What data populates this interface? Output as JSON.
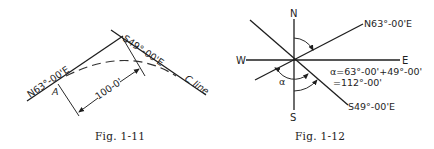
{
  "figures": [
    {
      "id": "fig-1-11",
      "caption": "Fig. 1-11",
      "labels": {
        "tangent_back": "N63°-00'E",
        "tangent_ahead": "S49°-00'E",
        "point_a": "A",
        "chord_length": "100-0'",
        "centerline": "C line"
      }
    },
    {
      "id": "fig-1-12",
      "caption": "Fig. 1-12",
      "labels": {
        "north": "N",
        "south": "S",
        "east": "E",
        "west": "W",
        "bearing_ne": "N63°-00'E",
        "bearing_se": "S49°-00'E",
        "alpha": "α",
        "formula_line1": "α=63°-00'+49°-00'",
        "formula_line2": "=112°-00'"
      }
    }
  ]
}
